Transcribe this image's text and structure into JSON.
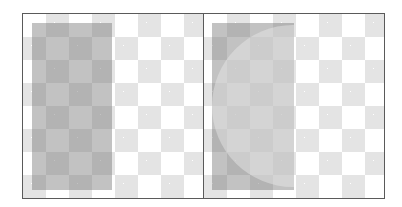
{
  "figure": {
    "colors": {
      "border": "#5a5a5a",
      "checker_light": "#e4e4e4",
      "checker_white": "#ffffff",
      "overlay": "#787878"
    },
    "panels": [
      {
        "id": "left",
        "label": ""
      },
      {
        "id": "right",
        "label": ""
      }
    ]
  }
}
